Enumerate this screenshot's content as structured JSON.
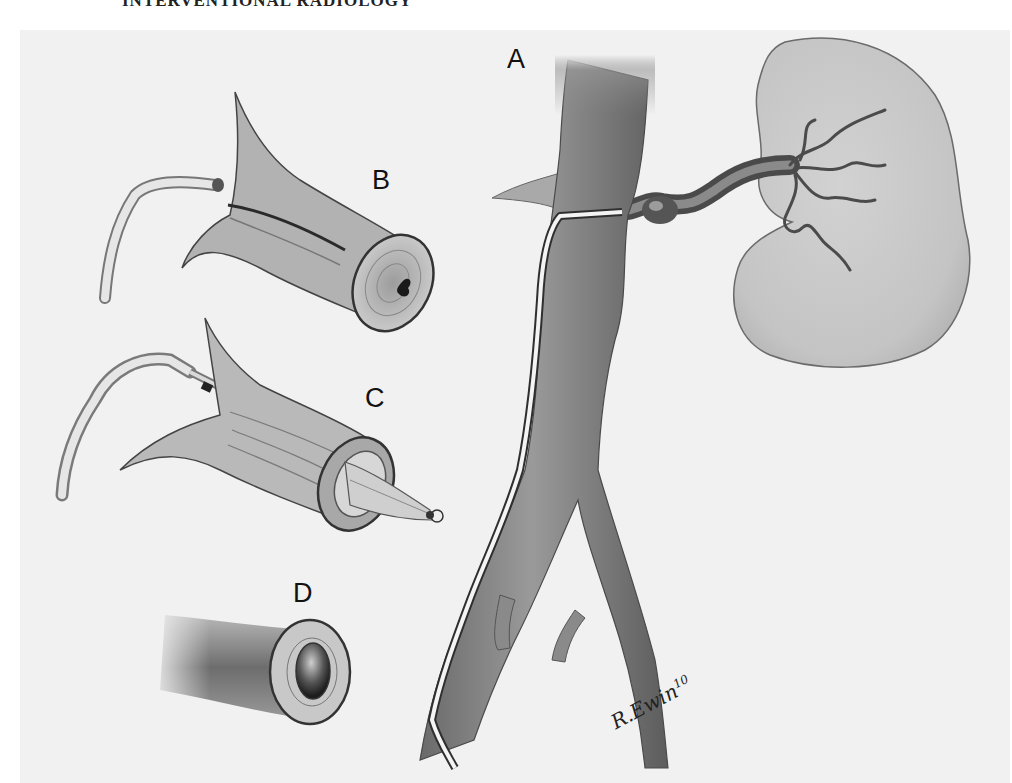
{
  "header": {
    "text": "INTERVENTIONAL RADIOLOGY"
  },
  "figure": {
    "labels": {
      "a": "A",
      "b": "B",
      "c": "C",
      "d": "D"
    },
    "signature": {
      "name": "R.Ewin",
      "year": "10"
    },
    "colors": {
      "background": "#f1f1f1",
      "vessel_dark": "#5a5a5a",
      "vessel_mid": "#8a8a8a",
      "kidney": "#c9c9c9",
      "outline": "#2a2a2a",
      "catheter": "#f4f4f4"
    }
  }
}
